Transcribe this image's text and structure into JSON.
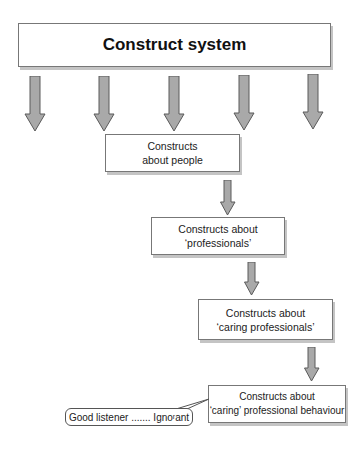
{
  "diagram": {
    "title": "Construct system",
    "nodes": [
      {
        "line1": "Constructs",
        "line2": "about people"
      },
      {
        "line1": "Constructs about",
        "line2": "‘professionals’"
      },
      {
        "line1": "Constructs about",
        "line2": "‘caring professionals’"
      },
      {
        "line1": "Constructs about",
        "line2": "‘caring’ professional behaviour"
      }
    ],
    "callout": "Good listener ....... Ignoʳant",
    "colors": {
      "arrow_fill": "#a9a9a9",
      "arrow_stroke": "#5a5a5a",
      "box_border": "#777777",
      "shadow": "#c4c4c4"
    }
  }
}
